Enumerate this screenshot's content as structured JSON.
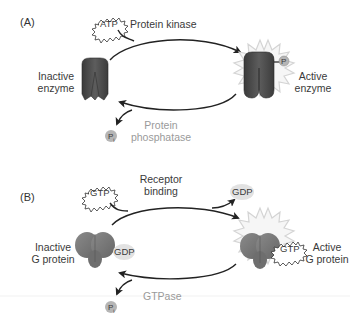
{
  "panel_a": {
    "label": "(A)",
    "input_molecule": "ATP",
    "forward_enzyme": "Protein kinase",
    "reverse_enzyme_line1": "Protein",
    "reverse_enzyme_line2": "phosphatase",
    "inactive_line1": "Inactive",
    "inactive_line2": "enzyme",
    "active_line1": "Active",
    "active_line2": "enzyme",
    "phosphate": "P",
    "released": "P",
    "released_sub": "i"
  },
  "panel_b": {
    "label": "(B)",
    "input_molecule": "GTP",
    "forward_process_line1": "Receptor",
    "forward_process_line2": "binding",
    "released_molecule": "GDP",
    "bound_inactive": "GDP",
    "bound_active": "GTP",
    "reverse_enzyme": "GTPase",
    "inactive_line1": "Inactive",
    "inactive_line2": "G protein",
    "active_line1": "Active",
    "active_line2": "G protein",
    "released": "P",
    "released_sub": "i"
  },
  "colors": {
    "enzyme_dark": "#4a4a4a",
    "g_protein": "#7a7a7a",
    "starburst": "#d8d8d8",
    "arrow": "#222222",
    "label_gray": "#9a9a9a",
    "phosphate_fill": "#b5b5b5"
  }
}
